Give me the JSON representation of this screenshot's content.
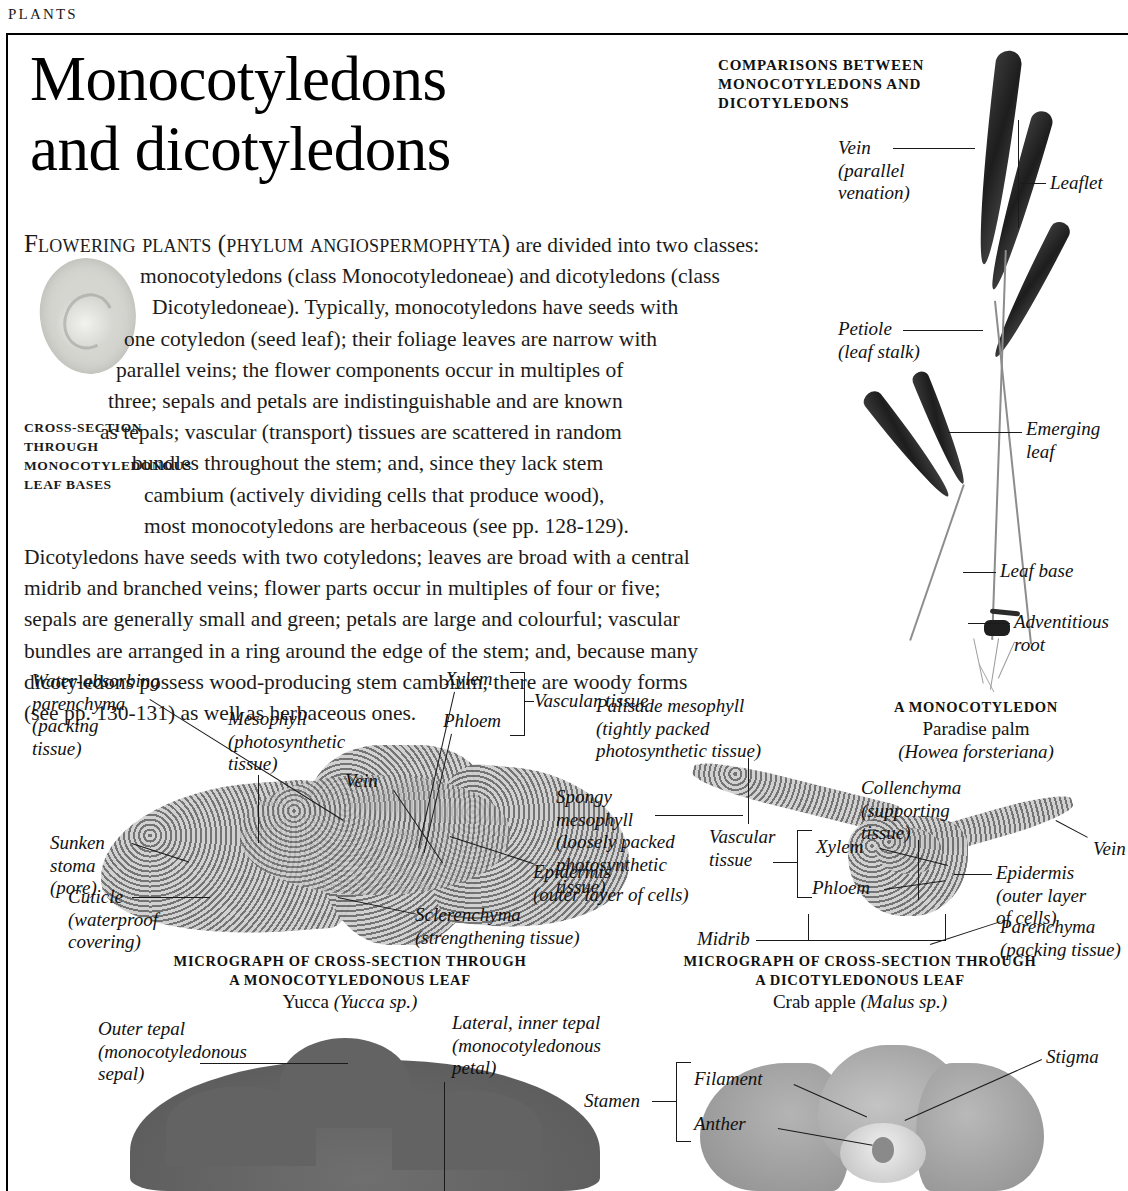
{
  "running_head": "PLANTS",
  "title": "Monocotyledons\nand dicotyledons",
  "intro": {
    "lines": [
      {
        "indent": "i0",
        "text": "FLOWERING PLANTS (PHYLUM ANGIOSPERMOPHYTA) are divided into two classes:"
      },
      {
        "indent": "i1",
        "text": "monocotyledons (class Monocotyledoneae) and dicotyledons (class"
      },
      {
        "indent": "i2",
        "text": "Dicotyledoneae). Typically, monocotyledons have seeds with"
      },
      {
        "indent": "i3",
        "text": "one cotyledon (seed leaf); their foliage leaves are narrow with"
      },
      {
        "indent": "i4",
        "text": "parallel veins; the flower components occur in multiples of"
      },
      {
        "indent": "i5",
        "text": "three; sepals and petals are indistinguishable and are known"
      },
      {
        "indent": "i6",
        "text": "as tepals; vascular (transport) tissues are scattered in random"
      },
      {
        "indent": "i7",
        "text": "bundles throughout the stem; and, since they lack stem"
      },
      {
        "indent": "i8",
        "text": "cambium (actively dividing cells that produce wood),"
      },
      {
        "indent": "i8",
        "text": "most monocotyledons are herbaceous (see pp. 128-129)."
      },
      {
        "indent": "i0",
        "text": "Dicotyledons have seeds with two cotyledons; leaves are broad with a central"
      },
      {
        "indent": "i0",
        "text": "midrib and branched veins; flower parts occur in multiples of four or five;"
      },
      {
        "indent": "i0",
        "text": "sepals are generally small and green; petals are large and colourful; vascular"
      },
      {
        "indent": "i0",
        "text": "bundles are arranged in a ring around the edge of the stem; and, because many"
      },
      {
        "indent": "i0",
        "text": "dicotyledons possess wood-producing stem cambium, there are woody forms"
      },
      {
        "indent": "i0",
        "text": "(see pp. 130-131) as well as herbaceous ones."
      }
    ],
    "lead_first_word": "F",
    "lead_smallcaps": "LOWERING PLANTS (PHYLUM ANGIOSPERMOPHYTA)"
  },
  "cross_section_caption": "CROSS-SECTION THROUGH MONOCOTYLEDONOUS LEAF BASES",
  "comparison_header": "COMPARISONS BETWEEN MONOCOTYLEDONS AND DICOTYLEDONS",
  "palm_labels": {
    "vein": "Vein\n(parallel\nvenation)",
    "leaflet": "Leaflet",
    "petiole": "Petiole\n(leaf  stalk)",
    "emerging_leaf": "Emerging\nleaf",
    "leaf_base": "Leaf base",
    "adventitious_root": "Adventitious\nroot"
  },
  "palm_caption": {
    "title": "A MONOCOTYLEDON",
    "common_name": "Paradise palm",
    "species": "(Howea forsteriana)"
  },
  "mono_micrograph_labels": {
    "water_absorbing": "Water-absorbing\nparenchyma\n(packing\ntissue)",
    "mesophyll": "Mesophyll\n(photosynthetic\ntissue)",
    "vein": "Vein",
    "sunken_stoma": "Sunken\nstoma\n(pore)",
    "cuticle": "Cuticle\n(waterproof\ncovering)",
    "xylem": "Xylem",
    "phloem": "Phloem",
    "vascular_tissue": "Vascular tissue",
    "sclerenchyma": "Sclerenchyma\n(strengthening tissue)",
    "epidermis": "Epidermis\n(outer layer of cells)"
  },
  "mono_micrograph_caption": {
    "line1": "MICROGRAPH OF CROSS-SECTION THROUGH",
    "line2": "A MONOCOTYLEDONOUS LEAF",
    "species_common": "Yucca",
    "species_latin": "(Yucca sp.)"
  },
  "dicot_micrograph_labels": {
    "palisade": "Palisade mesophyll\n(tightly packed\nphotosynthetic tissue)",
    "spongy": "Spongy\nmesophyll\n(loosely packed\nphotosynthetic\ntissue)",
    "collenchyma": "Collenchyma\n(supporting\ntissue)",
    "vein": "Vein",
    "epidermis": "Epidermis\n(outer layer\nof  cells)",
    "parenchyma": "Parenchyma\n(packing tissue)",
    "vascular_tissue": "Vascular\ntissue",
    "xylem": "Xylem",
    "phloem": "Phloem",
    "midrib": "Midrib"
  },
  "dicot_micrograph_caption": {
    "line1": "MICROGRAPH OF CROSS-SECTION THROUGH",
    "line2": "A DICOTYLEDONOUS LEAF",
    "species_common": "Crab apple",
    "species_latin": "(Malus sp.)"
  },
  "flower_labels": {
    "outer_tepal": "Outer tepal\n(monocotyledonous\nsepal)",
    "lateral_inner_tepal": "Lateral, inner tepal\n(monocotyledonous\npetal)",
    "stamen": "Stamen",
    "filament": "Filament",
    "anther": "Anther",
    "stigma": "Stigma"
  },
  "colors": {
    "ink": "#111111",
    "paper": "#ffffff",
    "rule": "#000000"
  }
}
